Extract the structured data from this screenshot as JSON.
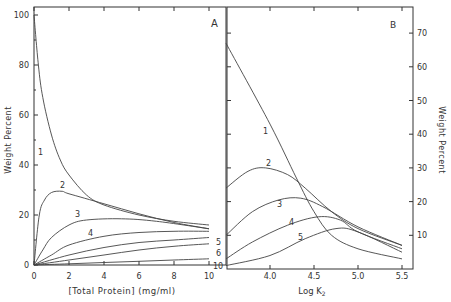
{
  "chart_data": [
    {
      "panel": "A",
      "type": "line",
      "xlabel": "[Total Protein] (mg/ml)",
      "ylabel": "Weight Percent",
      "xlim": [
        0,
        10
      ],
      "ylim": [
        0,
        100
      ],
      "xticks": [
        "0",
        "2",
        "4",
        "6",
        "8",
        "10"
      ],
      "yticks": [
        "0",
        "20",
        "40",
        "60",
        "80",
        "100"
      ],
      "series": [
        {
          "name": "1",
          "x": [
            0,
            0.25,
            0.5,
            1,
            1.5,
            2,
            3,
            4,
            6,
            8,
            10
          ],
          "y": [
            100,
            80,
            67,
            52,
            42,
            36,
            28,
            24,
            20,
            17.5,
            16
          ]
        },
        {
          "name": "2",
          "x": [
            0,
            0.3,
            0.6,
            1,
            1.6,
            2,
            4,
            6,
            8,
            10
          ],
          "y": [
            0,
            20,
            26,
            29,
            29.5,
            28.5,
            24.5,
            20.5,
            17,
            14.5
          ]
        },
        {
          "name": "3",
          "x": [
            0,
            0.5,
            1,
            2,
            3,
            5,
            7,
            10
          ],
          "y": [
            0,
            6,
            11,
            16,
            18,
            18.5,
            17.5,
            14.5
          ]
        },
        {
          "name": "4",
          "x": [
            0,
            1,
            2,
            4,
            6,
            8,
            10
          ],
          "y": [
            0,
            4,
            8,
            11.5,
            13,
            13.5,
            13.5
          ]
        },
        {
          "name": "5",
          "x": [
            0,
            2,
            4,
            6,
            8,
            10
          ],
          "y": [
            0,
            4,
            7,
            9,
            10,
            11
          ]
        },
        {
          "name": "6",
          "x": [
            0,
            2,
            4,
            6,
            8,
            10
          ],
          "y": [
            0,
            2,
            4,
            6,
            7.5,
            8.5
          ]
        },
        {
          "name": "10",
          "x": [
            0,
            2,
            4,
            6,
            8,
            10
          ],
          "y": [
            0,
            0.5,
            1,
            1.5,
            2,
            2.5
          ]
        }
      ]
    },
    {
      "panel": "B",
      "type": "line",
      "xlabel": "Log K2",
      "ylabel": "Weight Percent",
      "xlim": [
        3.5,
        5.6
      ],
      "ylim": [
        0,
        75
      ],
      "xticks": [
        "4.0",
        "4.5",
        "5.0",
        "5.5"
      ],
      "yticks": [
        "10",
        "20",
        "30",
        "40",
        "50",
        "60",
        "70"
      ],
      "series": [
        {
          "name": "1",
          "x": [
            3.5,
            4.0,
            4.3,
            4.5,
            4.7,
            5.0,
            5.5
          ],
          "y": [
            67,
            43,
            27,
            17,
            10,
            6,
            3
          ]
        },
        {
          "name": "2",
          "x": [
            3.5,
            3.75,
            3.95,
            4.2,
            4.4,
            4.7,
            5.0,
            5.5
          ],
          "y": [
            24,
            29,
            30,
            28,
            24,
            17,
            12,
            7
          ]
        },
        {
          "name": "3",
          "x": [
            3.5,
            3.8,
            4.1,
            4.35,
            4.6,
            5.0,
            5.5
          ],
          "y": [
            10,
            17,
            20.5,
            21,
            18.5,
            12.5,
            7
          ]
        },
        {
          "name": "4",
          "x": [
            3.5,
            3.8,
            4.2,
            4.55,
            4.8,
            5.0,
            5.5
          ],
          "y": [
            3,
            8,
            13,
            15.5,
            14.5,
            11,
            6
          ]
        },
        {
          "name": "5",
          "x": [
            3.5,
            4.0,
            4.4,
            4.75,
            5.0,
            5.5
          ],
          "y": [
            1,
            4,
            9,
            12,
            11,
            5
          ]
        }
      ]
    }
  ],
  "labels": {
    "panel_a": "A",
    "panel_b": "B",
    "a_ylabel": "Weight Percent",
    "a_xlabel": "[Total Protein] (mg/ml)",
    "b_ylabel": "Weight Percent",
    "b_xlabel": "Log K",
    "b_xlabel_sub": "2"
  }
}
